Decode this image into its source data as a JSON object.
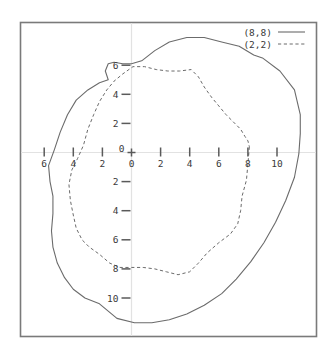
{
  "chart_data": {
    "type": "line",
    "title": "",
    "xlabel": "",
    "ylabel": "",
    "xlim": [
      -6.9,
      12.6
    ],
    "ylim": [
      -12.8,
      8.9
    ],
    "grid": false,
    "legend_position": "top-right",
    "axis_style": "centered-cross",
    "x_ticks": [
      {
        "value": -6,
        "label": "6"
      },
      {
        "value": -4,
        "label": "4"
      },
      {
        "value": -2,
        "label": "2"
      },
      {
        "value": 0,
        "label": "0"
      },
      {
        "value": 2,
        "label": "2"
      },
      {
        "value": 4,
        "label": "4"
      },
      {
        "value": 6,
        "label": "6"
      },
      {
        "value": 8,
        "label": "8"
      },
      {
        "value": 10,
        "label": "10"
      }
    ],
    "y_ticks": [
      {
        "value": 6,
        "label": "6"
      },
      {
        "value": 4,
        "label": "4"
      },
      {
        "value": 2,
        "label": "2"
      },
      {
        "value": 0,
        "label": "0"
      },
      {
        "value": -2,
        "label": "2"
      },
      {
        "value": -4,
        "label": "4"
      },
      {
        "value": -6,
        "label": "6"
      },
      {
        "value": -8,
        "label": "8"
      },
      {
        "value": -10,
        "label": "10"
      }
    ],
    "origin_label": "0",
    "series": [
      {
        "name": "(8,8)",
        "style": "solid",
        "color": "#6b6b6b",
        "closed": true,
        "points": [
          [
            11.6,
            2.6
          ],
          [
            11.2,
            4.3
          ],
          [
            10.2,
            5.6
          ],
          [
            9.0,
            6.5
          ],
          [
            8.4,
            6.7
          ],
          [
            7.4,
            7.3
          ],
          [
            6.2,
            7.6
          ],
          [
            5.0,
            7.9
          ],
          [
            3.8,
            7.9
          ],
          [
            2.6,
            7.6
          ],
          [
            1.6,
            7.0
          ],
          [
            0.7,
            6.3
          ],
          [
            0.0,
            6.1
          ],
          [
            -0.6,
            6.1
          ],
          [
            -1.2,
            6.2
          ],
          [
            -1.6,
            6.1
          ],
          [
            -1.8,
            5.6
          ],
          [
            -1.6,
            5.0
          ],
          [
            -2.2,
            4.8
          ],
          [
            -3.0,
            4.3
          ],
          [
            -3.8,
            3.6
          ],
          [
            -4.4,
            2.6
          ],
          [
            -4.9,
            1.4
          ],
          [
            -5.3,
            0.2
          ],
          [
            -5.7,
            -0.9
          ],
          [
            -5.6,
            -2.0
          ],
          [
            -5.4,
            -3.0
          ],
          [
            -5.4,
            -4.2
          ],
          [
            -5.5,
            -5.4
          ],
          [
            -5.4,
            -6.5
          ],
          [
            -5.1,
            -7.6
          ],
          [
            -4.6,
            -8.6
          ],
          [
            -4.0,
            -9.4
          ],
          [
            -3.2,
            -10.0
          ],
          [
            -2.2,
            -10.4
          ],
          [
            -1.0,
            -11.4
          ],
          [
            0.2,
            -11.7
          ],
          [
            1.4,
            -11.7
          ],
          [
            2.6,
            -11.5
          ],
          [
            3.8,
            -11.1
          ],
          [
            5.0,
            -10.5
          ],
          [
            6.2,
            -9.7
          ],
          [
            7.2,
            -8.7
          ],
          [
            8.2,
            -7.5
          ],
          [
            9.1,
            -6.2
          ],
          [
            9.9,
            -4.8
          ],
          [
            10.6,
            -3.3
          ],
          [
            11.2,
            -1.7
          ],
          [
            11.5,
            -0.1
          ],
          [
            11.6,
            1.3
          ]
        ]
      },
      {
        "name": "(2,2)",
        "style": "dashed",
        "color": "#6b6b6b",
        "closed": true,
        "points": [
          [
            8.1,
            0.4
          ],
          [
            8.0,
            -0.8
          ],
          [
            7.9,
            -1.9
          ],
          [
            7.6,
            -3.0
          ],
          [
            7.5,
            -4.0
          ],
          [
            7.3,
            -4.9
          ],
          [
            6.8,
            -5.6
          ],
          [
            6.0,
            -6.2
          ],
          [
            5.2,
            -6.9
          ],
          [
            4.6,
            -7.6
          ],
          [
            4.0,
            -8.2
          ],
          [
            3.2,
            -8.4
          ],
          [
            2.4,
            -8.2
          ],
          [
            1.6,
            -8.0
          ],
          [
            0.8,
            -7.9
          ],
          [
            0.0,
            -7.9
          ],
          [
            -0.8,
            -7.9
          ],
          [
            -1.5,
            -7.6
          ],
          [
            -2.2,
            -7.0
          ],
          [
            -2.9,
            -6.5
          ],
          [
            -3.4,
            -6.0
          ],
          [
            -3.8,
            -5.2
          ],
          [
            -4.0,
            -4.3
          ],
          [
            -4.2,
            -3.3
          ],
          [
            -4.3,
            -2.2
          ],
          [
            -4.1,
            -1.2
          ],
          [
            -3.7,
            -0.4
          ],
          [
            -3.3,
            0.5
          ],
          [
            -3.0,
            1.6
          ],
          [
            -2.6,
            2.6
          ],
          [
            -2.2,
            3.5
          ],
          [
            -1.7,
            4.3
          ],
          [
            -1.2,
            4.9
          ],
          [
            -0.6,
            5.4
          ],
          [
            0.1,
            5.9
          ],
          [
            0.9,
            5.9
          ],
          [
            1.7,
            5.7
          ],
          [
            2.5,
            5.6
          ],
          [
            3.3,
            5.6
          ],
          [
            4.1,
            5.7
          ],
          [
            4.6,
            5.2
          ],
          [
            5.0,
            4.5
          ],
          [
            5.5,
            3.8
          ],
          [
            6.0,
            3.2
          ],
          [
            6.5,
            2.6
          ],
          [
            7.0,
            2.1
          ],
          [
            7.5,
            1.6
          ],
          [
            7.8,
            1.1
          ],
          [
            8.0,
            0.8
          ]
        ]
      }
    ]
  },
  "legend": {
    "entries": [
      {
        "label": "(8,8)",
        "style": "solid"
      },
      {
        "label": "(2,2)",
        "style": "dashed"
      }
    ]
  }
}
